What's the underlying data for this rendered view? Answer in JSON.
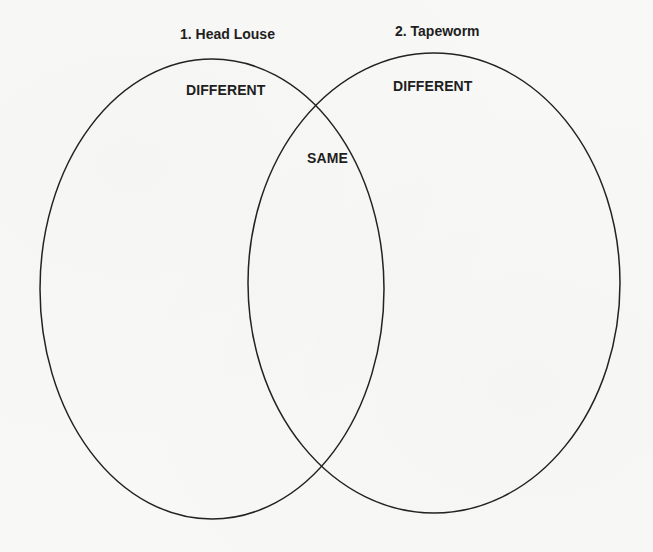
{
  "diagram": {
    "type": "venn",
    "sets": [
      {
        "id": "left",
        "title": "1. Head Louse",
        "region_label": "DIFFERENT",
        "ellipse": {
          "cx": 212,
          "cy": 289,
          "rx": 172,
          "ry": 230
        }
      },
      {
        "id": "right",
        "title": "2. Tapeworm",
        "region_label": "DIFFERENT",
        "ellipse": {
          "cx": 434,
          "cy": 283,
          "rx": 186,
          "ry": 230
        }
      }
    ],
    "overlap_label": "SAME",
    "colors": {
      "stroke": "#222222",
      "text": "#1e1e1e",
      "background": "#f8f8f6"
    }
  }
}
